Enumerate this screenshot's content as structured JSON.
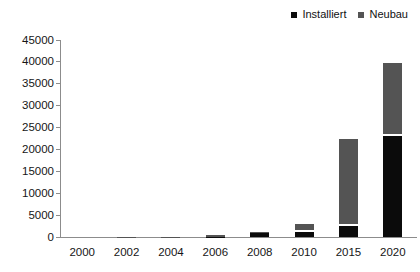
{
  "chart": {
    "legend": [
      {
        "label": "Installiert",
        "color": "#0b0b0b"
      },
      {
        "label": "Neubau",
        "color": "#545454"
      }
    ]
  },
  "chart_data": {
    "type": "bar",
    "stacked": true,
    "title": "",
    "xlabel": "",
    "ylabel": "",
    "categories": [
      "2000",
      "2002",
      "2004",
      "2006",
      "2008",
      "2010",
      "2015",
      "2020"
    ],
    "series": [
      {
        "name": "Installiert",
        "color": "#0b0b0b",
        "values": [
          0,
          0,
          0,
          100,
          800,
          1200,
          2500,
          23000
        ]
      },
      {
        "name": "Neubau",
        "color": "#545454",
        "values": [
          0,
          50,
          100,
          400,
          400,
          1700,
          20000,
          16800
        ]
      }
    ],
    "totals": [
      0,
      50,
      100,
      500,
      1200,
      2900,
      22500,
      39800
    ],
    "ylim": [
      0,
      45000
    ],
    "ytick_step": 5000,
    "yticks": [
      0,
      5000,
      10000,
      15000,
      20000,
      25000,
      30000,
      35000,
      40000,
      45000
    ],
    "legend_position": "top-right",
    "grid": false,
    "axis_color": "#8c8c8c",
    "tick_label_color": "#161616",
    "segment_gap_color": "#ffffff"
  }
}
